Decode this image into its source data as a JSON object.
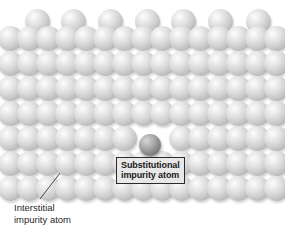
{
  "figure": {
    "name": "crystal-lattice-impurity-diagram",
    "width": 285,
    "height": 229,
    "background_color": "#ffffff"
  },
  "colors": {
    "host_atom": "#cfcfcf",
    "substitutional_atom": "#8d8d8d",
    "label_box_fill": "#e8e8e8",
    "label_box_border": "#2b2b2b",
    "leader_line": "#4a4a4a",
    "text": "#2a2a2a"
  },
  "labels": {
    "substitutional": {
      "line1": "Substitutional",
      "line2": "impurity atom"
    },
    "interstitial": {
      "line1": "Interstitial",
      "line2": "impurity atom"
    }
  },
  "leaders": [
    {
      "name": "interstitial-leader-line",
      "x1": 60,
      "y1": 173,
      "x2": 40,
      "y2": 199
    }
  ],
  "chart_data": {
    "type": "scatter",
    "xlabel": "",
    "ylabel": "",
    "xlim": [
      0,
      285
    ],
    "ylim": [
      0,
      229
    ],
    "grid": false,
    "legend": null,
    "annotations": [
      {
        "text": "Substitutional impurity atom",
        "points_to": [
          150,
          145
        ],
        "box_at": [
          116,
          157
        ]
      },
      {
        "text": "Interstitial impurity atom",
        "points_to": [
          60,
          173
        ],
        "box_at": [
          14,
          202
        ]
      }
    ],
    "series": [
      {
        "name": "host atoms",
        "marker": "sphere",
        "color": "#cfcfcf",
        "radius": 12.5,
        "points": [
          [
            37,
            21
          ],
          [
            73,
            21
          ],
          [
            110,
            21
          ],
          [
            147,
            21
          ],
          [
            183,
            21
          ],
          [
            220,
            21
          ],
          [
            258,
            21
          ],
          [
            10,
            38
          ],
          [
            29,
            38
          ],
          [
            48,
            38
          ],
          [
            67,
            38
          ],
          [
            86,
            38
          ],
          [
            105,
            38
          ],
          [
            124,
            38
          ],
          [
            143,
            38
          ],
          [
            162,
            38
          ],
          [
            181,
            38
          ],
          [
            200,
            38
          ],
          [
            219,
            38
          ],
          [
            238,
            38
          ],
          [
            257,
            38
          ],
          [
            276,
            38
          ],
          [
            10,
            63
          ],
          [
            29,
            63
          ],
          [
            48,
            63
          ],
          [
            67,
            63
          ],
          [
            86,
            63
          ],
          [
            105,
            63
          ],
          [
            124,
            63
          ],
          [
            143,
            63
          ],
          [
            162,
            63
          ],
          [
            181,
            63
          ],
          [
            200,
            63
          ],
          [
            219,
            63
          ],
          [
            238,
            63
          ],
          [
            257,
            63
          ],
          [
            276,
            63
          ],
          [
            10,
            88
          ],
          [
            29,
            88
          ],
          [
            48,
            88
          ],
          [
            67,
            88
          ],
          [
            86,
            88
          ],
          [
            105,
            88
          ],
          [
            124,
            88
          ],
          [
            143,
            88
          ],
          [
            162,
            88
          ],
          [
            181,
            88
          ],
          [
            200,
            88
          ],
          [
            219,
            88
          ],
          [
            238,
            88
          ],
          [
            257,
            88
          ],
          [
            276,
            88
          ],
          [
            10,
            113
          ],
          [
            29,
            113
          ],
          [
            48,
            113
          ],
          [
            67,
            113
          ],
          [
            86,
            113
          ],
          [
            105,
            113
          ],
          [
            124,
            113
          ],
          [
            143,
            113
          ],
          [
            162,
            113
          ],
          [
            181,
            113
          ],
          [
            200,
            113
          ],
          [
            219,
            113
          ],
          [
            238,
            113
          ],
          [
            257,
            113
          ],
          [
            276,
            113
          ],
          [
            10,
            138
          ],
          [
            29,
            138
          ],
          [
            48,
            138
          ],
          [
            67,
            138
          ],
          [
            86,
            138
          ],
          [
            105,
            138
          ],
          [
            124,
            138
          ],
          [
            181,
            138
          ],
          [
            200,
            138
          ],
          [
            219,
            138
          ],
          [
            238,
            138
          ],
          [
            257,
            138
          ],
          [
            276,
            138
          ],
          [
            10,
            163
          ],
          [
            29,
            163
          ],
          [
            48,
            163
          ],
          [
            67,
            163
          ],
          [
            86,
            163
          ],
          [
            105,
            163
          ],
          [
            124,
            163
          ],
          [
            143,
            163
          ],
          [
            162,
            163
          ],
          [
            181,
            163
          ],
          [
            200,
            163
          ],
          [
            219,
            163
          ],
          [
            238,
            163
          ],
          [
            257,
            163
          ],
          [
            276,
            163
          ],
          [
            10,
            188
          ],
          [
            29,
            188
          ],
          [
            48,
            188
          ],
          [
            67,
            188
          ],
          [
            86,
            188
          ],
          [
            105,
            188
          ],
          [
            124,
            188
          ],
          [
            143,
            188
          ],
          [
            162,
            188
          ],
          [
            181,
            188
          ],
          [
            200,
            188
          ],
          [
            219,
            188
          ],
          [
            238,
            188
          ],
          [
            257,
            188
          ],
          [
            276,
            188
          ]
        ]
      },
      {
        "name": "substitutional impurity atom",
        "marker": "sphere",
        "color": "#8d8d8d",
        "radius": 11,
        "points": [
          [
            150,
            145
          ]
        ]
      }
    ]
  }
}
